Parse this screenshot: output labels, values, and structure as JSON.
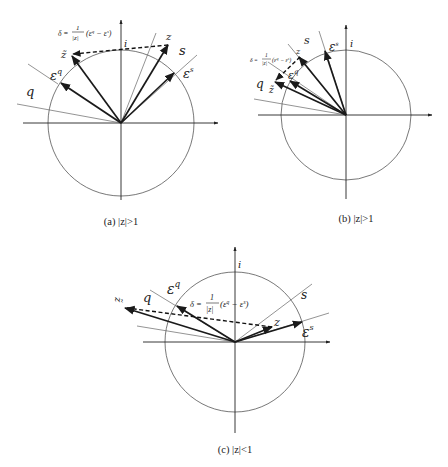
{
  "figure": {
    "panels": [
      {
        "id": "a",
        "caption": "(a) |z|>1",
        "labels": {
          "imag_axis": "i",
          "s_line": "s",
          "q_line": "q",
          "eps_s": "ε",
          "eps_s_sup": "s",
          "eps_q": "ε",
          "eps_q_sup": "q",
          "z": "z",
          "z_tilde": "z̃",
          "delta_prefix": "δ =",
          "delta_num": "1",
          "delta_den": "|z|",
          "delta_paren": "(ε",
          "delta_sup1": "q",
          "delta_mid": " − ε",
          "delta_sup2": "s",
          "delta_close": ")"
        }
      },
      {
        "id": "b",
        "caption": "(b) |z|>1",
        "labels": {
          "imag_axis": "i",
          "s_line": "s",
          "q_line": "q",
          "eps_s": "ε",
          "eps_s_sup": "s",
          "eps_q": "ε",
          "eps_q_sup": "q",
          "z": "z",
          "z_tilde": "z̃",
          "delta_prefix": "δ =",
          "delta_num": "1",
          "delta_den": "|z|",
          "delta_paren": "(ε",
          "delta_sup1": "q",
          "delta_mid": " − ε",
          "delta_sup2": "s",
          "delta_close": ")"
        }
      },
      {
        "id": "c",
        "caption": "(c) |z|<1",
        "labels": {
          "imag_axis": "i",
          "s_line": "s",
          "q_line": "q",
          "eps_s": "ε",
          "eps_s_sup": "s",
          "eps_q": "ε",
          "eps_q_sup": "q",
          "z": "z",
          "z_tilde": "z̃",
          "delta_prefix": "δ =",
          "delta_num": "1",
          "delta_den": "|z|",
          "delta_paren": "(ε",
          "delta_sup1": "q",
          "delta_mid": " − ε",
          "delta_sup2": "s",
          "delta_close": ")"
        }
      }
    ]
  }
}
